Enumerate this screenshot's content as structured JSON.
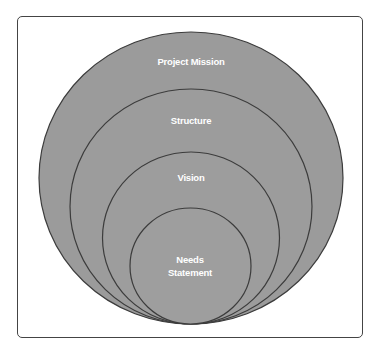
{
  "diagram": {
    "type": "nested-circles",
    "colors": {
      "fill": "#9b9b9b",
      "stroke": "#3c3c3c",
      "text": "#ffffff",
      "frame": "#444444"
    },
    "layers": [
      {
        "label": "Project Mission",
        "lines": [
          "Project Mission"
        ]
      },
      {
        "label": "Structure",
        "lines": [
          "Structure"
        ]
      },
      {
        "label": "Vision",
        "lines": [
          "Vision"
        ]
      },
      {
        "label": "Needs Statement",
        "lines": [
          "Needs",
          "Statement"
        ]
      }
    ]
  }
}
